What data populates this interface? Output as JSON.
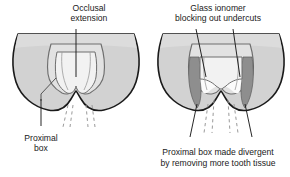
{
  "figure": {
    "background_color": "#ffffff",
    "panels": [
      {
        "id": "left",
        "name": "conventional-preparation",
        "annotation_label": {
          "line1": "Occlusal",
          "line2": "extension"
        },
        "callout_label": {
          "line1": "Proximal",
          "line2": "box"
        }
      },
      {
        "id": "right",
        "name": "glass-ionomer-preparation",
        "annotation_label": {
          "line1": "Glass ionomer",
          "line2": "blocking out undercuts"
        },
        "caption": {
          "line1": "Proximal box made divergent",
          "line2": "by removing more tooth tissue"
        }
      }
    ],
    "colors": {
      "tooth_fill": "#d2d2d2",
      "tooth_fill_light": "#e8e8e8",
      "cavity_fill": "#f2f2f2",
      "cavity_inner": "#e0e0e0",
      "ionomer_fill": "#8e8e8e",
      "outline": "#1a1a1a",
      "inner_line": "#6e6e6e",
      "dashed_line": "#9a9a9a",
      "text": "#1a1a1a"
    }
  }
}
